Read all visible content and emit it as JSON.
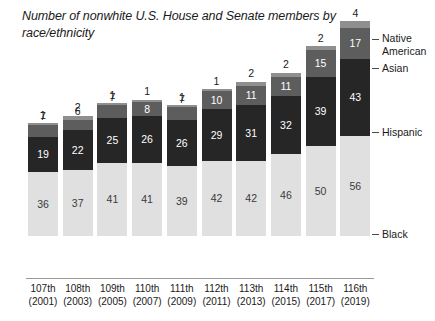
{
  "chart_data": {
    "type": "bar",
    "stacked": true,
    "title": "Number of nonwhite U.S. House and Senate members by race/ethnicity",
    "xlabel": "",
    "ylabel": "",
    "grid": false,
    "legend_position": "right-callouts",
    "categories": [
      {
        "congress": "107th",
        "year": "(2001)"
      },
      {
        "congress": "108th",
        "year": "(2003)"
      },
      {
        "congress": "109th",
        "year": "(2005)"
      },
      {
        "congress": "110th",
        "year": "(2007)"
      },
      {
        "congress": "111th",
        "year": "(2009)"
      },
      {
        "congress": "112th",
        "year": "(2011)"
      },
      {
        "congress": "113th",
        "year": "(2013)"
      },
      {
        "congress": "114th",
        "year": "(2015)"
      },
      {
        "congress": "115th",
        "year": "(2017)"
      },
      {
        "congress": "116th",
        "year": "(2019)"
      }
    ],
    "series": [
      {
        "name": "Black",
        "color": "#e0e0e0",
        "label_color": "#3a3a3a",
        "values": [
          36,
          37,
          41,
          41,
          39,
          42,
          42,
          46,
          50,
          56
        ]
      },
      {
        "name": "Hispanic",
        "color": "#262626",
        "label_color": "#ffffff",
        "values": [
          19,
          22,
          25,
          26,
          26,
          29,
          31,
          32,
          39,
          43
        ]
      },
      {
        "name": "Asian",
        "color": "#5d5d5d",
        "label_color": "#ffffff",
        "values": [
          7,
          6,
          7,
          8,
          7,
          10,
          11,
          11,
          15,
          17
        ]
      },
      {
        "name": "Native American",
        "color": "#8f8f8f",
        "label_color": "#ffffff",
        "values": [
          1,
          2,
          1,
          1,
          1,
          1,
          2,
          2,
          2,
          4
        ]
      }
    ],
    "totals": [
      63,
      67,
      74,
      76,
      73,
      82,
      86,
      91,
      106,
      120
    ],
    "ylim": [
      0,
      120
    ]
  },
  "legend": {
    "native_american": "Native American",
    "asian": "Asian",
    "hispanic": "Hispanic",
    "black": "Black"
  }
}
